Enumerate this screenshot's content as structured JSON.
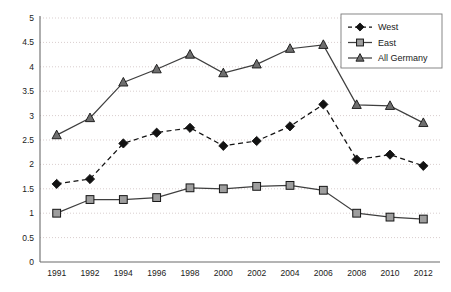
{
  "chart_data": {
    "type": "line",
    "title": "",
    "subtitle": "",
    "xlabel": "",
    "ylabel": "",
    "categories": [
      "1991",
      "1992",
      "1994",
      "1996",
      "1998",
      "2000",
      "2002",
      "2004",
      "2006",
      "2008",
      "2010",
      "2012"
    ],
    "ylim": [
      0,
      5
    ],
    "ytick_labels": [
      "0",
      "0.5",
      "1",
      "1.5",
      "2",
      "2.5",
      "3",
      "3.5",
      "4",
      "4.5",
      "5"
    ],
    "ytick_values": [
      0,
      0.5,
      1,
      1.5,
      2,
      2.5,
      3,
      3.5,
      4,
      4.5,
      5
    ],
    "grid": true,
    "grid_axis": "y",
    "legend_position": "top-right",
    "series": [
      {
        "name": "West",
        "marker": "diamond",
        "line_style": "dashed",
        "color": "#121212",
        "marker_fill": "#121212",
        "values": [
          1.6,
          1.7,
          2.43,
          2.65,
          2.75,
          2.38,
          2.48,
          2.78,
          3.23,
          2.1,
          2.2,
          1.97
        ]
      },
      {
        "name": "East",
        "marker": "square",
        "line_style": "solid",
        "color": "#3f3f3f",
        "marker_fill": "#9e9e9e",
        "values": [
          1.0,
          1.28,
          1.28,
          1.32,
          1.52,
          1.5,
          1.55,
          1.57,
          1.47,
          1.0,
          0.92,
          0.88
        ]
      },
      {
        "name": "All Germany",
        "marker": "triangle",
        "line_style": "solid",
        "color": "#3f3f3f",
        "marker_fill": "#6e6e6e",
        "values": [
          2.6,
          2.95,
          3.68,
          3.95,
          4.25,
          3.87,
          4.05,
          4.37,
          4.45,
          3.22,
          3.2,
          2.85
        ]
      }
    ]
  },
  "legend": {
    "items": [
      {
        "label": "West"
      },
      {
        "label": "East"
      },
      {
        "label": "All Germany"
      }
    ]
  },
  "colors": {
    "grid": "#c9b9b9",
    "axis": "#6b6b6b",
    "text": "#1a1a1a",
    "background": "#ffffff"
  }
}
